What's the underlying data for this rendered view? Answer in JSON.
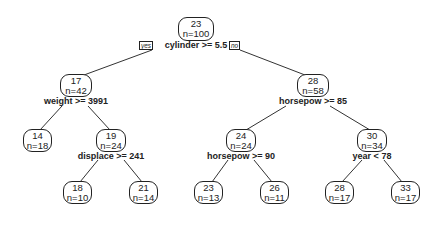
{
  "tree": {
    "root": {
      "value": "23",
      "n": "n=100",
      "split": "cylinder >= 5.5",
      "yes_label": "yes",
      "no_label": "no"
    },
    "nodes": [
      {
        "id": "n17",
        "value": "17",
        "n": "n=42",
        "split": "weight >= 3991"
      },
      {
        "id": "n28",
        "value": "28",
        "n": "n=58",
        "split": "horsepow >= 85"
      },
      {
        "id": "n14",
        "value": "14",
        "n": "n=18"
      },
      {
        "id": "n19",
        "value": "19",
        "n": "n=24",
        "split": "displace >= 241"
      },
      {
        "id": "n24",
        "value": "24",
        "n": "n=24",
        "split": "horsepow >= 90"
      },
      {
        "id": "n30",
        "value": "30",
        "n": "n=34",
        "split": "year < 78"
      },
      {
        "id": "n18",
        "value": "18",
        "n": "n=10"
      },
      {
        "id": "n21",
        "value": "21",
        "n": "n=14"
      },
      {
        "id": "n23",
        "value": "23",
        "n": "n=13"
      },
      {
        "id": "n26",
        "value": "26",
        "n": "n=11"
      },
      {
        "id": "n28b",
        "value": "28",
        "n": "n=17"
      },
      {
        "id": "n33",
        "value": "33",
        "n": "n=17"
      }
    ]
  }
}
